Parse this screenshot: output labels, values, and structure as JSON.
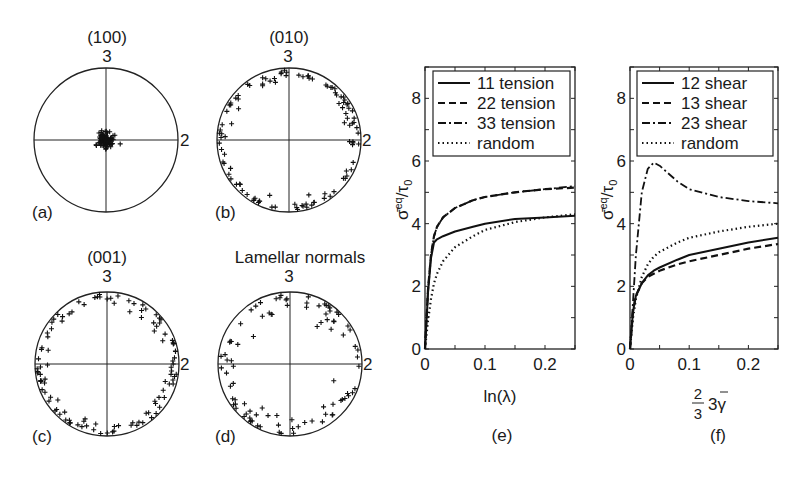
{
  "figure": {
    "pole_figures": [
      {
        "panel": "(a)",
        "title": "(100)",
        "axis_top": "3",
        "axis_right": "2",
        "distribution": "clustered-center"
      },
      {
        "panel": "(b)",
        "title": "(010)",
        "axis_top": "3",
        "axis_right": "2",
        "distribution": "rim"
      },
      {
        "panel": "(c)",
        "title": "(001)",
        "axis_top": "3",
        "axis_right": "2",
        "distribution": "rim"
      },
      {
        "panel": "(d)",
        "title": "Lamellar normals",
        "axis_top": "3",
        "axis_right": "2",
        "distribution": "rim-diffuse"
      }
    ],
    "left_side_label": "2"
  },
  "chart_data": [
    {
      "type": "line",
      "panel": "(e)",
      "title": "",
      "xlabel": "ln(λ)",
      "ylabel": "σ̄eq/τ0",
      "xlim": [
        0,
        0.25
      ],
      "ylim": [
        0,
        9
      ],
      "xticks": [
        "0",
        "0.1",
        "0.2"
      ],
      "yticks": [
        "0",
        "2",
        "4",
        "6",
        "8"
      ],
      "grid": false,
      "legend_position": "upper-right",
      "x": [
        0,
        0.005,
        0.01,
        0.015,
        0.02,
        0.03,
        0.05,
        0.08,
        0.1,
        0.15,
        0.2,
        0.25
      ],
      "series": [
        {
          "name": "11 tension",
          "style": "solid",
          "values": [
            0,
            1.8,
            2.9,
            3.4,
            3.5,
            3.6,
            3.75,
            3.9,
            4.0,
            4.15,
            4.2,
            4.25
          ]
        },
        {
          "name": "22 tension",
          "style": "dashed",
          "values": [
            0,
            1.9,
            3.0,
            3.6,
            3.9,
            4.2,
            4.5,
            4.75,
            4.85,
            5.0,
            5.1,
            5.15
          ]
        },
        {
          "name": "33 tension",
          "style": "dash-dot",
          "values": [
            0,
            1.9,
            3.0,
            3.6,
            3.9,
            4.2,
            4.5,
            4.75,
            4.85,
            5.0,
            5.1,
            5.2
          ]
        },
        {
          "name": "random",
          "style": "dotted",
          "values": [
            0,
            0.9,
            1.6,
            2.1,
            2.4,
            2.8,
            3.25,
            3.6,
            3.8,
            4.05,
            4.2,
            4.3
          ]
        }
      ]
    },
    {
      "type": "line",
      "panel": "(f)",
      "title": "",
      "xlabel": "2/3 3γ̄",
      "ylabel": "σ̄eq/τ0",
      "xlim": [
        0,
        0.25
      ],
      "ylim": [
        0,
        9
      ],
      "xticks": [
        "0",
        "0.1",
        "0.2"
      ],
      "yticks": [
        "0",
        "2",
        "4",
        "6",
        "8"
      ],
      "grid": false,
      "legend_position": "upper-right",
      "x": [
        0,
        0.005,
        0.01,
        0.02,
        0.03,
        0.04,
        0.05,
        0.08,
        0.1,
        0.15,
        0.2,
        0.25
      ],
      "series": [
        {
          "name": "12 shear",
          "style": "solid",
          "values": [
            0,
            1.2,
            1.7,
            2.1,
            2.35,
            2.5,
            2.6,
            2.85,
            3.0,
            3.2,
            3.4,
            3.55
          ]
        },
        {
          "name": "13 shear",
          "style": "dashed",
          "values": [
            0,
            1.2,
            1.7,
            2.1,
            2.3,
            2.4,
            2.5,
            2.7,
            2.8,
            3.0,
            3.2,
            3.35
          ]
        },
        {
          "name": "23 shear",
          "style": "dash-dot",
          "values": [
            0,
            1.5,
            3.0,
            5.0,
            5.75,
            5.95,
            5.85,
            5.35,
            5.1,
            4.85,
            4.72,
            4.65
          ]
        },
        {
          "name": "random",
          "style": "dotted",
          "values": [
            0,
            1.0,
            1.6,
            2.3,
            2.7,
            2.95,
            3.1,
            3.4,
            3.55,
            3.75,
            3.9,
            4.0
          ]
        }
      ]
    }
  ]
}
